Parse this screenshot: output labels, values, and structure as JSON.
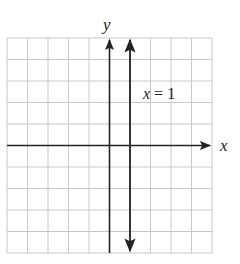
{
  "graph": {
    "x_axis_label": "x",
    "y_axis_label": "y",
    "line_label_var": "x",
    "line_label_rest": " = 1",
    "line_equation": "x = 1",
    "grid": {
      "columns": 10,
      "rows": 10,
      "color": "#c8c8c8"
    },
    "axis_color": "#222222",
    "line_color": "#333333",
    "x_range": [
      -5,
      5
    ],
    "y_range": [
      -5,
      5
    ],
    "line": {
      "type": "vertical",
      "x": 1
    }
  }
}
